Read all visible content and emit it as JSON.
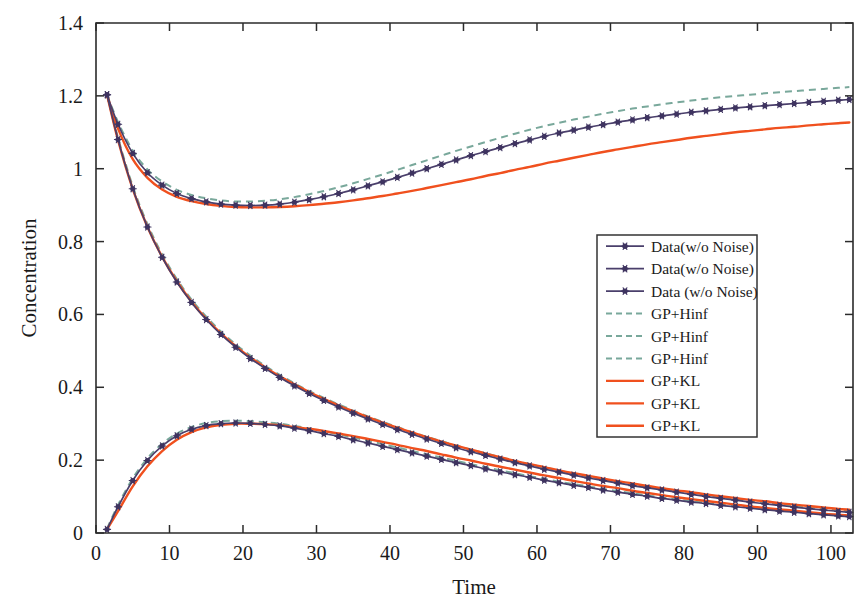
{
  "chart_data": {
    "type": "line",
    "title": "",
    "xlabel": "Time",
    "ylabel": "Concentration",
    "xlim": [
      0,
      103
    ],
    "ylim": [
      0,
      1.4
    ],
    "xticks": [
      0,
      10,
      20,
      30,
      40,
      50,
      60,
      70,
      80,
      90,
      100
    ],
    "xtick_labels": [
      "0",
      "10",
      "20",
      "30",
      "40",
      "50",
      "60",
      "70",
      "80",
      "90",
      "100"
    ],
    "yticks": [
      0,
      0.2,
      0.4,
      0.6,
      0.8,
      1.0,
      1.2,
      1.4
    ],
    "ytick_labels": [
      "0",
      "0.2",
      "0.4",
      "0.6",
      "0.8",
      "1",
      "1.2",
      "1.4"
    ],
    "grid": false,
    "legend_position": "center-right",
    "colors": {
      "data": "#4a3f6b",
      "data_marker": "#3f3460",
      "gp_hinf": "#79a89b",
      "gp_kl": "#f0501e",
      "axis": "#2b2b2b",
      "text": "#1a1a1a"
    },
    "x": [
      1.5,
      3,
      5,
      7,
      9,
      11,
      13,
      15,
      17,
      19,
      21,
      23,
      25,
      27,
      29,
      31,
      33,
      35,
      37,
      39,
      41,
      43,
      45,
      47,
      49,
      51,
      53,
      55,
      57,
      59,
      61,
      63,
      65,
      67,
      69,
      71,
      73,
      75,
      77,
      79,
      81,
      83,
      85,
      87,
      89,
      91,
      93,
      95,
      97,
      99,
      101,
      102.5
    ],
    "series": [
      {
        "name": "Data(w/o Noise)",
        "style": "markers-line",
        "color": "#4a3f6b",
        "curve_id": 1,
        "values": [
          1.203,
          1.122,
          1.042,
          0.989,
          0.955,
          0.932,
          0.918,
          0.909,
          0.903,
          0.9,
          0.899,
          0.9,
          0.903,
          0.908,
          0.915,
          0.923,
          0.932,
          0.942,
          0.953,
          0.964,
          0.976,
          0.988,
          1.0,
          1.012,
          1.024,
          1.036,
          1.047,
          1.058,
          1.069,
          1.079,
          1.089,
          1.098,
          1.106,
          1.114,
          1.121,
          1.128,
          1.134,
          1.14,
          1.145,
          1.15,
          1.155,
          1.159,
          1.163,
          1.167,
          1.17,
          1.173,
          1.176,
          1.179,
          1.182,
          1.185,
          1.188,
          1.19
        ]
      },
      {
        "name": "Data(w/o Noise)",
        "style": "markers-line",
        "color": "#4a3f6b",
        "curve_id": 2,
        "values": [
          1.203,
          1.08,
          0.945,
          0.84,
          0.757,
          0.689,
          0.633,
          0.586,
          0.545,
          0.51,
          0.479,
          0.452,
          0.427,
          0.404,
          0.383,
          0.364,
          0.346,
          0.329,
          0.313,
          0.298,
          0.284,
          0.271,
          0.258,
          0.246,
          0.234,
          0.223,
          0.213,
          0.203,
          0.193,
          0.184,
          0.175,
          0.167,
          0.159,
          0.151,
          0.144,
          0.137,
          0.13,
          0.124,
          0.118,
          0.112,
          0.106,
          0.1,
          0.095,
          0.09,
          0.085,
          0.08,
          0.076,
          0.071,
          0.067,
          0.063,
          0.059,
          0.057
        ]
      },
      {
        "name": "Data (w/o Noise)",
        "style": "markers-line",
        "color": "#4a3f6b",
        "curve_id": 3,
        "values": [
          0.01,
          0.072,
          0.144,
          0.199,
          0.239,
          0.267,
          0.285,
          0.295,
          0.3,
          0.302,
          0.301,
          0.298,
          0.294,
          0.288,
          0.281,
          0.273,
          0.265,
          0.256,
          0.247,
          0.238,
          0.229,
          0.22,
          0.211,
          0.202,
          0.193,
          0.185,
          0.176,
          0.168,
          0.16,
          0.153,
          0.145,
          0.138,
          0.131,
          0.125,
          0.118,
          0.112,
          0.106,
          0.101,
          0.095,
          0.09,
          0.085,
          0.081,
          0.076,
          0.072,
          0.068,
          0.064,
          0.06,
          0.057,
          0.053,
          0.05,
          0.047,
          0.045
        ]
      },
      {
        "name": "GP+Hinf",
        "style": "dashed",
        "color": "#79a89b",
        "curve_id": 1,
        "values": [
          1.203,
          1.128,
          1.05,
          0.998,
          0.965,
          0.942,
          0.928,
          0.919,
          0.913,
          0.91,
          0.91,
          0.912,
          0.916,
          0.922,
          0.93,
          0.939,
          0.949,
          0.96,
          0.972,
          0.984,
          0.997,
          1.01,
          1.023,
          1.036,
          1.049,
          1.061,
          1.073,
          1.085,
          1.096,
          1.107,
          1.117,
          1.126,
          1.135,
          1.143,
          1.151,
          1.158,
          1.165,
          1.171,
          1.177,
          1.182,
          1.187,
          1.192,
          1.196,
          1.2,
          1.203,
          1.207,
          1.21,
          1.213,
          1.216,
          1.219,
          1.222,
          1.224
        ]
      },
      {
        "name": "GP+Hinf",
        "style": "dashed",
        "color": "#79a89b",
        "curve_id": 2,
        "values": [
          1.203,
          1.085,
          0.952,
          0.848,
          0.765,
          0.697,
          0.641,
          0.594,
          0.553,
          0.518,
          0.487,
          0.459,
          0.434,
          0.411,
          0.39,
          0.371,
          0.353,
          0.336,
          0.32,
          0.305,
          0.291,
          0.277,
          0.264,
          0.252,
          0.24,
          0.229,
          0.219,
          0.208,
          0.198,
          0.189,
          0.18,
          0.171,
          0.163,
          0.155,
          0.148,
          0.14,
          0.134,
          0.127,
          0.121,
          0.115,
          0.109,
          0.103,
          0.098,
          0.093,
          0.088,
          0.083,
          0.078,
          0.074,
          0.07,
          0.066,
          0.062,
          0.06
        ]
      },
      {
        "name": "GP+Hinf",
        "style": "dashed",
        "color": "#79a89b",
        "curve_id": 3,
        "values": [
          0.012,
          0.077,
          0.15,
          0.205,
          0.245,
          0.273,
          0.291,
          0.302,
          0.307,
          0.308,
          0.307,
          0.304,
          0.3,
          0.294,
          0.287,
          0.279,
          0.271,
          0.262,
          0.253,
          0.244,
          0.235,
          0.225,
          0.216,
          0.207,
          0.198,
          0.189,
          0.181,
          0.172,
          0.164,
          0.156,
          0.149,
          0.141,
          0.134,
          0.128,
          0.121,
          0.115,
          0.109,
          0.103,
          0.098,
          0.092,
          0.087,
          0.083,
          0.078,
          0.074,
          0.07,
          0.066,
          0.062,
          0.058,
          0.055,
          0.052,
          0.048,
          0.046
        ]
      },
      {
        "name": "GP+KL",
        "style": "solid",
        "color": "#f0501e",
        "curve_id": 1,
        "values": [
          1.203,
          1.11,
          1.026,
          0.975,
          0.943,
          0.923,
          0.911,
          0.903,
          0.898,
          0.895,
          0.894,
          0.894,
          0.895,
          0.897,
          0.9,
          0.904,
          0.908,
          0.913,
          0.919,
          0.925,
          0.932,
          0.939,
          0.947,
          0.955,
          0.963,
          0.971,
          0.98,
          0.988,
          0.997,
          1.005,
          1.014,
          1.022,
          1.03,
          1.038,
          1.046,
          1.053,
          1.06,
          1.067,
          1.073,
          1.079,
          1.085,
          1.09,
          1.095,
          1.1,
          1.104,
          1.108,
          1.112,
          1.115,
          1.119,
          1.122,
          1.125,
          1.127
        ]
      },
      {
        "name": "GP+KL",
        "style": "solid",
        "color": "#f0501e",
        "curve_id": 2,
        "values": [
          1.203,
          1.078,
          0.944,
          0.84,
          0.758,
          0.691,
          0.635,
          0.588,
          0.548,
          0.513,
          0.482,
          0.455,
          0.43,
          0.408,
          0.387,
          0.368,
          0.35,
          0.334,
          0.318,
          0.303,
          0.289,
          0.276,
          0.263,
          0.251,
          0.24,
          0.229,
          0.218,
          0.208,
          0.198,
          0.189,
          0.181,
          0.172,
          0.164,
          0.157,
          0.149,
          0.142,
          0.136,
          0.129,
          0.123,
          0.117,
          0.112,
          0.106,
          0.101,
          0.096,
          0.091,
          0.087,
          0.082,
          0.078,
          0.074,
          0.07,
          0.066,
          0.064
        ]
      },
      {
        "name": "GP+KL",
        "style": "solid",
        "color": "#f0501e",
        "curve_id": 3,
        "values": [
          0.01,
          0.06,
          0.128,
          0.183,
          0.225,
          0.256,
          0.277,
          0.29,
          0.297,
          0.3,
          0.3,
          0.299,
          0.296,
          0.291,
          0.286,
          0.28,
          0.273,
          0.266,
          0.258,
          0.25,
          0.242,
          0.233,
          0.225,
          0.216,
          0.207,
          0.199,
          0.19,
          0.182,
          0.174,
          0.166,
          0.158,
          0.151,
          0.143,
          0.136,
          0.129,
          0.123,
          0.116,
          0.11,
          0.104,
          0.098,
          0.093,
          0.088,
          0.083,
          0.078,
          0.073,
          0.069,
          0.065,
          0.061,
          0.057,
          0.053,
          0.05,
          0.048
        ]
      }
    ],
    "legend_entries": [
      {
        "label": "Data(w/o Noise)",
        "style": "markers-line",
        "color": "#4a3f6b"
      },
      {
        "label": "Data(w/o Noise)",
        "style": "markers-line",
        "color": "#4a3f6b"
      },
      {
        "label": "Data (w/o Noise)",
        "style": "markers-line",
        "color": "#4a3f6b"
      },
      {
        "label": "GP+Hinf",
        "style": "dashed",
        "color": "#79a89b"
      },
      {
        "label": "GP+Hinf",
        "style": "dashed",
        "color": "#79a89b"
      },
      {
        "label": "GP+Hinf",
        "style": "dashed",
        "color": "#79a89b"
      },
      {
        "label": "GP+KL",
        "style": "solid",
        "color": "#f0501e"
      },
      {
        "label": "GP+KL",
        "style": "solid",
        "color": "#f0501e"
      },
      {
        "label": "GP+KL",
        "style": "solid",
        "color": "#f0501e"
      }
    ]
  }
}
